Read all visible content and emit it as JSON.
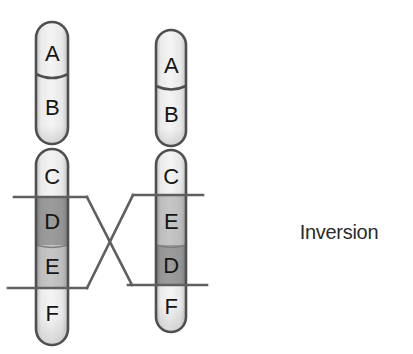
{
  "annotation": {
    "label": "Inversion"
  },
  "chromosomes": {
    "left": {
      "top_segments": [
        {
          "label": "A",
          "shade": "light"
        },
        {
          "label": "B",
          "shade": "light"
        }
      ],
      "bottom_segments": [
        {
          "label": "C",
          "shade": "light"
        },
        {
          "label": "D",
          "shade": "dark"
        },
        {
          "label": "E",
          "shade": "medium"
        },
        {
          "label": "F",
          "shade": "light"
        }
      ]
    },
    "right": {
      "top_segments": [
        {
          "label": "A",
          "shade": "light"
        },
        {
          "label": "B",
          "shade": "light"
        }
      ],
      "bottom_segments": [
        {
          "label": "C",
          "shade": "light"
        },
        {
          "label": "E",
          "shade": "medium"
        },
        {
          "label": "D",
          "shade": "dark"
        },
        {
          "label": "F",
          "shade": "light"
        }
      ]
    }
  },
  "colors": {
    "light_segment": "#f4f4f4",
    "medium_segment": "#c6c6c6",
    "dark_segment": "#9c9c9c",
    "outline": "#4f4f4f",
    "cut_line": "#5f5f5f",
    "label_text": "#151515"
  }
}
